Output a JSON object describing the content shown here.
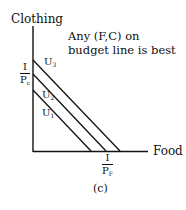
{
  "diagram": {
    "y_axis_label": "Clothing",
    "x_axis_label": "Food",
    "annotation_line1": "Any (F,C) on",
    "annotation_line2": "budget line is best",
    "y_intercept_label": {
      "numerator": "I",
      "denominator": "P",
      "denominator_sub": "c"
    },
    "x_intercept_label": {
      "numerator": "I",
      "denominator": "P",
      "denominator_sub": "F"
    },
    "curves": [
      {
        "name": "U",
        "sub": "3",
        "x1": 33,
        "y1": 60,
        "x2": 120,
        "y2": 151
      },
      {
        "name": "U",
        "sub": "2",
        "x1": 33,
        "y1": 74,
        "x2": 106,
        "y2": 151
      },
      {
        "name": "U",
        "sub": "1",
        "x1": 33,
        "y1": 90,
        "x2": 91,
        "y2": 151
      }
    ],
    "caption": "(c)"
  }
}
